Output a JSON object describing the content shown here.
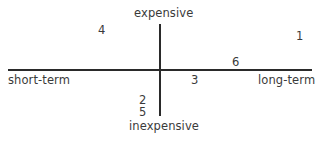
{
  "diagram": {
    "type": "quadrant",
    "axes": {
      "top": "expensive",
      "bottom": "inexpensive",
      "left": "short-term",
      "right": "long-term"
    },
    "points": [
      {
        "label": "1",
        "quadrant": "long-term / expensive"
      },
      {
        "label": "2",
        "quadrant": "on axis / inexpensive"
      },
      {
        "label": "3",
        "quadrant": "long-term / slightly inexpensive"
      },
      {
        "label": "4",
        "quadrant": "short-term / expensive"
      },
      {
        "label": "5",
        "quadrant": "on axis / inexpensive"
      },
      {
        "label": "6",
        "quadrant": "long-term / slightly expensive"
      }
    ]
  }
}
